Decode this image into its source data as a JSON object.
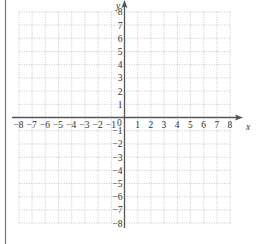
{
  "diagram": {
    "type": "coordinate-grid",
    "x_axis_label": "x",
    "y_axis_label": "y",
    "x_range": [
      -8,
      8
    ],
    "y_range": [
      -8,
      8
    ],
    "x_ticks": [
      "-8",
      "-7",
      "-6",
      "-5",
      "-4",
      "-3",
      "-2",
      "-1",
      "1",
      "2",
      "3",
      "4",
      "5",
      "6",
      "7",
      "8"
    ],
    "y_ticks": [
      "8",
      "7",
      "6",
      "5",
      "4",
      "3",
      "2",
      "1",
      "-1",
      "-2",
      "-3",
      "-4",
      "-5",
      "-6",
      "-7",
      "-8"
    ],
    "origin_label": "0",
    "grid": "dotted",
    "colors": {
      "axis": "#555555",
      "grid": "#b8b8b8",
      "border": "#777777",
      "text": "#333333"
    }
  }
}
